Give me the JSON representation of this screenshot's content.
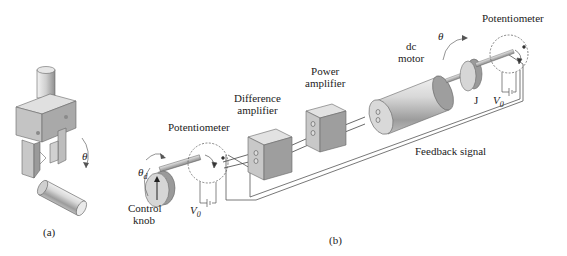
{
  "figure": {
    "panel_a": {
      "caption": "(a)",
      "angle_label": "θ"
    },
    "panel_b": {
      "caption": "(b)",
      "labels": {
        "potentiometer_input": "Potentiometer",
        "control_knob_line1": "Control",
        "control_knob_line2": "knob",
        "theta_d": "θ",
        "theta_d_sub": "d",
        "v0_input": "V",
        "v0_input_sub": "0",
        "difference_amp_line1": "Difference",
        "difference_amp_line2": "amplifier",
        "power_amp_line1": "Power",
        "power_amp_line2": "amplifier",
        "dc_motor_line1": "dc",
        "dc_motor_line2": "motor",
        "theta_output": "θ",
        "inertia": "J",
        "potentiometer_output": "Potentiometer",
        "v0_output": "V",
        "v0_output_sub": "0",
        "feedback": "Feedback signal"
      }
    },
    "colors": {
      "line": "#555555",
      "box_front": "#c8c8c8",
      "box_side": "#9a9a9a",
      "box_top": "#e2e2e2",
      "text": "#222222"
    }
  }
}
